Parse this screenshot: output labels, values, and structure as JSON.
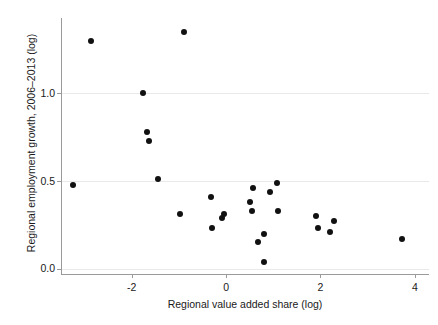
{
  "chart_data": {
    "type": "scatter",
    "title": "",
    "xlabel": "Regional value added share (log)",
    "ylabel": "Regional employment growth, 2006–2013 (log)",
    "xlim": [
      -3.5,
      4.3
    ],
    "ylim": [
      -0.03,
      1.43
    ],
    "xticks": [
      -2,
      0,
      2,
      4
    ],
    "xticklabels": [
      "-2",
      "0",
      "2",
      "4"
    ],
    "yticks": [
      0.0,
      0.5,
      1.0
    ],
    "yticklabels": [
      "0.0",
      "0.5",
      "1.0"
    ],
    "grid": "horizontal",
    "legend": "none",
    "marker": {
      "shape": "circle",
      "color": "#111111",
      "size": 6
    },
    "series": [
      {
        "name": "regions",
        "points": [
          {
            "x": -3.25,
            "y": 0.48
          },
          {
            "x": -2.86,
            "y": 1.3
          },
          {
            "x": -1.76,
            "y": 1.0
          },
          {
            "x": -1.67,
            "y": 0.78
          },
          {
            "x": -1.63,
            "y": 0.73
          },
          {
            "x": -1.45,
            "y": 0.51
          },
          {
            "x": -0.9,
            "y": 1.35
          },
          {
            "x": -0.98,
            "y": 0.31
          },
          {
            "x": -0.33,
            "y": 0.41
          },
          {
            "x": -0.29,
            "y": 0.23
          },
          {
            "x": -0.08,
            "y": 0.29
          },
          {
            "x": -0.04,
            "y": 0.31
          },
          {
            "x": 0.57,
            "y": 0.46
          },
          {
            "x": 0.51,
            "y": 0.38
          },
          {
            "x": 0.55,
            "y": 0.33
          },
          {
            "x": 0.67,
            "y": 0.15
          },
          {
            "x": 0.8,
            "y": 0.2
          },
          {
            "x": 0.8,
            "y": 0.04
          },
          {
            "x": 0.92,
            "y": 0.44
          },
          {
            "x": 1.07,
            "y": 0.49
          },
          {
            "x": 1.1,
            "y": 0.33
          },
          {
            "x": 1.9,
            "y": 0.3
          },
          {
            "x": 1.94,
            "y": 0.23
          },
          {
            "x": 2.2,
            "y": 0.21
          },
          {
            "x": 2.29,
            "y": 0.27
          },
          {
            "x": 3.72,
            "y": 0.17
          }
        ]
      }
    ]
  }
}
